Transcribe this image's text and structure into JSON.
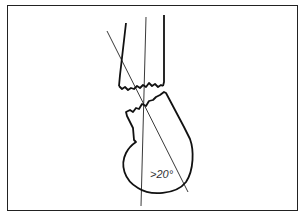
{
  "diagram": {
    "annotations": {
      "angle_label": ">20°"
    },
    "elements": [
      "humeral shaft",
      "fracture line",
      "humeral head",
      "shaft axis line",
      "head axis line"
    ],
    "colors": {
      "line": "#111111",
      "background": "#ffffff"
    }
  }
}
